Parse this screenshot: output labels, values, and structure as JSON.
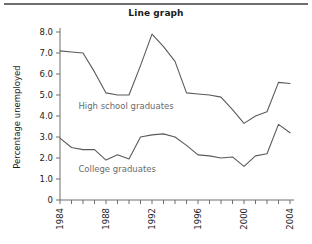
{
  "figure": {
    "title": "Line graph",
    "top_rule_color": "#6e6e6e"
  },
  "chart_data": {
    "type": "line",
    "title": "Line graph",
    "xlabel": "",
    "ylabel": "Percentage unemployed",
    "xlim": [
      1984,
      2004
    ],
    "ylim": [
      0,
      8
    ],
    "grid": false,
    "legend": "inline-labels",
    "x": [
      1984,
      1985,
      1986,
      1987,
      1988,
      1989,
      1990,
      1991,
      1992,
      1993,
      1994,
      1995,
      1996,
      1997,
      1998,
      1999,
      2000,
      2001,
      2002,
      2003,
      2004
    ],
    "y_ticks": [
      "0",
      "1.0",
      "2.0",
      "3.0",
      "4.0",
      "5.0",
      "6.0",
      "7.0",
      "8.0"
    ],
    "y_tick_values": [
      0,
      1,
      2,
      3,
      4,
      5,
      6,
      7,
      8
    ],
    "x_ticks_labeled": [
      "1984",
      "1988",
      "1992",
      "1996",
      "2000",
      "2004"
    ],
    "series": [
      {
        "name": "High school graduates",
        "color": "#5a5a5a",
        "label_x": 1985.6,
        "label_y": 4.35,
        "values": [
          7.1,
          7.05,
          7.0,
          6.1,
          5.1,
          5.0,
          5.0,
          6.4,
          7.9,
          7.3,
          6.6,
          5.1,
          5.05,
          5.0,
          4.9,
          4.3,
          3.65,
          4.0,
          4.2,
          5.6,
          5.55
        ]
      },
      {
        "name": "College graduates",
        "color": "#5a5a5a",
        "label_x": 1985.6,
        "label_y": 1.35,
        "values": [
          2.95,
          2.5,
          2.4,
          2.4,
          1.9,
          2.15,
          1.95,
          3.0,
          3.1,
          3.15,
          3.0,
          2.6,
          2.15,
          2.1,
          2.0,
          2.05,
          1.6,
          2.1,
          2.2,
          3.6,
          3.2
        ]
      }
    ]
  }
}
